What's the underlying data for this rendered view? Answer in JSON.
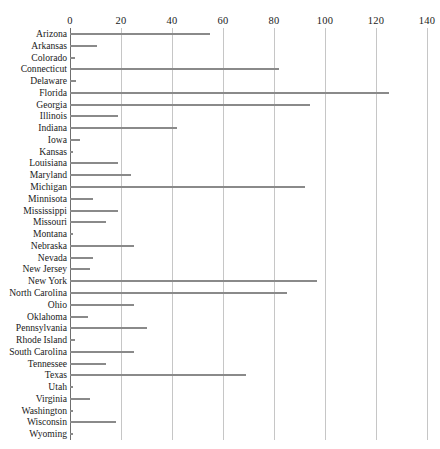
{
  "title": {
    "visible_text": "",
    "note_rendered": "clipped above top edge, illegible"
  },
  "chart_data": {
    "type": "bar",
    "orientation": "horizontal",
    "title": "",
    "xlabel": "",
    "ylabel": "",
    "xlim": [
      0,
      140
    ],
    "xticks": [
      0,
      20,
      40,
      60,
      80,
      100,
      120,
      140
    ],
    "grid": true,
    "grid_axis": "x",
    "legend": false,
    "bar_color": "#8a8a8a",
    "axis_color": "#6f6f6f",
    "gridline_color": "#c6c6c6",
    "categories": [
      "Arizona",
      "Arkansas",
      "Colorado",
      "Connecticut",
      "Delaware",
      "Florida",
      "Georgia",
      "Illinois",
      "Indiana",
      "Iowa",
      "Kansas",
      "Louisiana",
      "Maryland",
      "Michigan",
      "Minnisota",
      "Mississippi",
      "Missouri",
      "Montana",
      "Nebraska",
      "Nevada",
      "New Jersey",
      "New York",
      "North Carolina",
      "Ohio",
      "Oklahoma",
      "Pennsylvania",
      "Rhode Island",
      "South Carolina",
      "Tennessee",
      "Texas",
      "Utah",
      "Virginia",
      "Washington",
      "Wisconsin",
      "Wyoming"
    ],
    "values": [
      55,
      10.5,
      2,
      82,
      2.5,
      125,
      94,
      19,
      42,
      4,
      1,
      19,
      24,
      92,
      9,
      19,
      14,
      1,
      25,
      9,
      8,
      97,
      85,
      25,
      7,
      30,
      2,
      25,
      14,
      69,
      1,
      8,
      1,
      18,
      1
    ]
  }
}
